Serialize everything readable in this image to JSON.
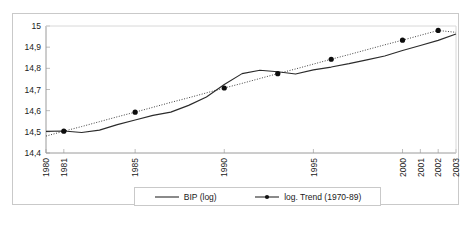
{
  "chart_data": {
    "type": "line",
    "title": "",
    "xlabel": "",
    "ylabel": "",
    "ylim": [
      14.4,
      15.0
    ],
    "xlim": [
      1980,
      2003
    ],
    "yticks": [
      "14,4",
      "14,5",
      "14,6",
      "14,7",
      "14,8",
      "14,9",
      "15"
    ],
    "ytick_values": [
      14.4,
      14.5,
      14.6,
      14.7,
      14.8,
      14.9,
      15.0
    ],
    "xticks": [
      "1980",
      "1981",
      "1985",
      "1990",
      "1995",
      "2000",
      "2001",
      "2002",
      "2003"
    ],
    "xtick_values": [
      1980,
      1981,
      1985,
      1990,
      1995,
      2000,
      2001,
      2002,
      2003
    ],
    "grid": false,
    "legend_position": "bottom",
    "x": [
      1980,
      1981,
      1982,
      1983,
      1984,
      1985,
      1986,
      1987,
      1988,
      1989,
      1990,
      1991,
      1992,
      1993,
      1994,
      1995,
      1996,
      1997,
      1998,
      1999,
      2000,
      2001,
      2002,
      2003
    ],
    "series": [
      {
        "name": "BIP (log)",
        "style": "solid",
        "markers": false,
        "color": "#2b2b2b",
        "values": [
          14.502,
          14.504,
          14.497,
          14.508,
          14.534,
          14.556,
          14.578,
          14.593,
          14.625,
          14.665,
          14.724,
          14.775,
          14.791,
          14.784,
          14.773,
          14.793,
          14.806,
          14.822,
          14.84,
          14.858,
          14.884,
          14.908,
          14.932,
          14.962
        ]
      },
      {
        "name": "log. Trend (1970-89)",
        "style": "dotted",
        "markers": true,
        "color": "#2b2b2b",
        "marker_years": [
          1981,
          1985,
          1990,
          1993,
          1996,
          2000,
          2002
        ],
        "values": [
          14.48,
          14.503,
          14.525,
          14.548,
          14.571,
          14.593,
          14.616,
          14.639,
          14.661,
          14.684,
          14.707,
          14.729,
          14.752,
          14.775,
          14.797,
          14.82,
          14.843,
          14.865,
          14.888,
          14.911,
          14.933,
          14.956,
          14.979,
          14.97
        ]
      }
    ]
  },
  "legend": {
    "entries": [
      {
        "label": "BIP (log)"
      },
      {
        "label": "log. Trend (1970-89)"
      }
    ]
  }
}
